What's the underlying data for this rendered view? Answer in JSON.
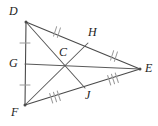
{
  "figure": {
    "canvas": {
      "width": 158,
      "height": 126
    },
    "colors": {
      "side_stroke": "#4a4a4a",
      "median_stroke": "#5a5a5a",
      "tick_stroke": "#9a9a9a",
      "label_color": "#222222",
      "background": "#ffffff"
    },
    "vertices": [
      {
        "id": "D",
        "label": "D",
        "x": 26,
        "y": 22,
        "label_x": 9,
        "label_y": 5,
        "role": "triangle-vertex"
      },
      {
        "id": "F",
        "label": "F",
        "x": 25,
        "y": 105,
        "label_x": 11,
        "label_y": 106,
        "role": "triangle-vertex"
      },
      {
        "id": "E",
        "label": "E",
        "x": 140,
        "y": 69,
        "label_x": 145,
        "label_y": 62,
        "role": "triangle-vertex"
      }
    ],
    "midpoints": [
      {
        "id": "G",
        "label": "G",
        "x": 25,
        "y": 64,
        "label_x": 9,
        "label_y": 57,
        "on_segment": "DF"
      },
      {
        "id": "H",
        "label": "H",
        "x": 88,
        "y": 43,
        "label_x": 88,
        "label_y": 26,
        "on_segment": "DE"
      },
      {
        "id": "J",
        "label": "J",
        "x": 85,
        "y": 88,
        "label_x": 85,
        "label_y": 89,
        "on_segment": "FE"
      }
    ],
    "centroid": {
      "id": "C",
      "label": "C",
      "x": 66,
      "y": 62,
      "label_x": 59,
      "label_y": 46
    },
    "sides": [
      {
        "id": "DF",
        "from": "D",
        "to": "F"
      },
      {
        "id": "DE",
        "from": "D",
        "to": "E"
      },
      {
        "id": "FE",
        "from": "F",
        "to": "E"
      }
    ],
    "medians": [
      {
        "id": "DJ",
        "from": "D",
        "to": "J"
      },
      {
        "id": "FH",
        "from": "F",
        "to": "H"
      },
      {
        "id": "GE",
        "from": "G",
        "to": "E"
      }
    ],
    "tick_groups": [
      {
        "id": "DG",
        "segment": "DG",
        "count": 1,
        "x": 25,
        "y": 43,
        "angle": 90
      },
      {
        "id": "GF",
        "segment": "GF",
        "count": 1,
        "x": 25,
        "y": 85,
        "angle": 90
      },
      {
        "id": "DH",
        "segment": "DH",
        "count": 2,
        "x": 57,
        "y": 32,
        "angle": 18
      },
      {
        "id": "HE",
        "segment": "HE",
        "count": 2,
        "x": 114,
        "y": 56,
        "angle": 18
      },
      {
        "id": "FJ",
        "segment": "FJ",
        "count": 3,
        "x": 55,
        "y": 97,
        "angle": -18
      },
      {
        "id": "JE",
        "segment": "JE",
        "count": 3,
        "x": 113,
        "y": 79,
        "angle": -18
      }
    ]
  }
}
